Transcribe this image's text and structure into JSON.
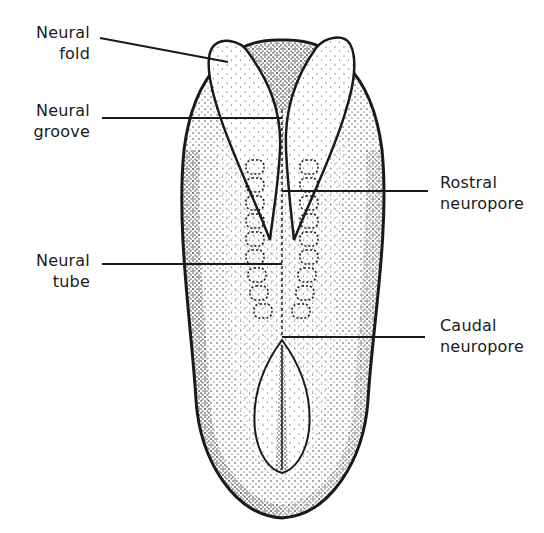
{
  "figure": {
    "type": "anatomical illustration",
    "colors": {
      "ink": "#1a1a1a",
      "background": "#ffffff"
    }
  },
  "labels": [
    {
      "id": "neural-fold",
      "side": "left",
      "lines": [
        "Neural",
        "fold"
      ]
    },
    {
      "id": "neural-groove",
      "side": "left",
      "lines": [
        "Neural",
        "groove"
      ]
    },
    {
      "id": "neural-tube",
      "side": "left",
      "lines": [
        "Neural",
        "tube"
      ]
    },
    {
      "id": "rostral-neuropore",
      "side": "right",
      "lines": [
        "Rostral",
        "neuropore"
      ]
    },
    {
      "id": "caudal-neuropore",
      "side": "right",
      "lines": [
        "Caudal",
        "neuropore"
      ]
    }
  ]
}
